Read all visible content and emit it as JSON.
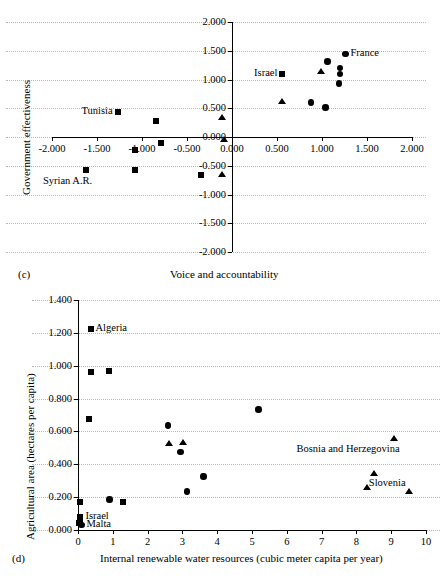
{
  "figure": {
    "panels": [
      "(c)",
      "(d)"
    ]
  },
  "chart_data": [
    {
      "id": "panel-c",
      "type": "scatter",
      "panel_letter": "(c)",
      "title": "",
      "xlabel": "Voice and accountability",
      "ylabel": "Government effectiveness",
      "xlim": [
        -2.0,
        2.0
      ],
      "ylim": [
        -2.0,
        2.0
      ],
      "grid": true,
      "xticks": [
        "-2.000",
        "-1.500",
        "-1.000",
        "-0.500",
        "0.000",
        "0.500",
        "1.000",
        "1.500",
        "2.000"
      ],
      "xtick_values": [
        -2.0,
        -1.5,
        -1.0,
        -0.5,
        0.0,
        0.5,
        1.0,
        1.5,
        2.0
      ],
      "yticks": [
        "2.000",
        "1.500",
        "1.000",
        "0.500",
        "0.000",
        "-0.500",
        "-1.000",
        "-1.500",
        "-2.000"
      ],
      "ytick_values": [
        2.0,
        1.5,
        1.0,
        0.5,
        0.0,
        -0.5,
        -1.0,
        -1.5,
        -2.0
      ],
      "series": [
        {
          "name": "square-series",
          "marker": "square",
          "points": [
            {
              "x": -1.27,
              "y": 0.43,
              "label": "Tunisia",
              "label_pos": "left"
            },
            {
              "x": -0.84,
              "y": 0.28
            },
            {
              "x": -0.79,
              "y": -0.11
            },
            {
              "x": -1.08,
              "y": -0.22
            },
            {
              "x": -1.62,
              "y": -0.58,
              "label": "Syrian A.R.",
              "label_pos": "below-left"
            },
            {
              "x": -1.08,
              "y": -0.58
            },
            {
              "x": -0.34,
              "y": -0.66
            },
            {
              "x": 0.56,
              "y": 1.09,
              "label": "Israel",
              "label_pos": "left"
            }
          ]
        },
        {
          "name": "triangle-series",
          "marker": "triangle",
          "points": [
            {
              "x": -0.11,
              "y": 0.34
            },
            {
              "x": -0.09,
              "y": -0.03
            },
            {
              "x": 0.56,
              "y": 0.63
            },
            {
              "x": 0.99,
              "y": 1.15
            },
            {
              "x": -0.11,
              "y": -0.64
            }
          ]
        },
        {
          "name": "circle-series",
          "marker": "circle",
          "points": [
            {
              "x": 1.26,
              "y": 1.44,
              "label": "France",
              "label_pos": "right"
            },
            {
              "x": 1.06,
              "y": 1.31
            },
            {
              "x": 1.2,
              "y": 1.2
            },
            {
              "x": 1.2,
              "y": 1.1
            },
            {
              "x": 1.19,
              "y": 0.93
            },
            {
              "x": 0.88,
              "y": 0.6
            },
            {
              "x": 1.04,
              "y": 0.51
            }
          ]
        }
      ]
    },
    {
      "id": "panel-d",
      "type": "scatter",
      "panel_letter": "(d)",
      "title": "",
      "xlabel": "Internal renewable water resources (cubic meter capita per year)",
      "ylabel": "Agricultural area (hectares per capita)",
      "xlim": [
        0,
        10
      ],
      "ylim": [
        0.0,
        1.4
      ],
      "grid": true,
      "xticks": [
        "0",
        "1",
        "2",
        "3",
        "4",
        "5",
        "6",
        "7",
        "8",
        "9",
        "10"
      ],
      "xtick_values": [
        0,
        1,
        2,
        3,
        4,
        5,
        6,
        7,
        8,
        9,
        10
      ],
      "yticks": [
        "1.400",
        "1.200",
        "1.000",
        "0.800",
        "0.600",
        "0.400",
        "0.200",
        "0.000"
      ],
      "ytick_values": [
        1.4,
        1.2,
        1.0,
        0.8,
        0.6,
        0.4,
        0.2,
        0.0
      ],
      "series": [
        {
          "name": "square-series",
          "marker": "square",
          "points": [
            {
              "x": 0.36,
              "y": 1.222,
              "label": "Algeria",
              "label_pos": "right"
            },
            {
              "x": 0.38,
              "y": 0.962
            },
            {
              "x": 0.9,
              "y": 0.968
            },
            {
              "x": 0.33,
              "y": 0.678
            },
            {
              "x": 0.07,
              "y": 0.17
            },
            {
              "x": 1.3,
              "y": 0.17
            },
            {
              "x": 0.07,
              "y": 0.078,
              "label": "Israel",
              "label_pos": "right"
            },
            {
              "x": 0.05,
              "y": 0.048
            },
            {
              "x": 0.03,
              "y": 0.04
            }
          ]
        },
        {
          "name": "circle-series",
          "marker": "circle",
          "points": [
            {
              "x": 5.18,
              "y": 0.735
            },
            {
              "x": 2.58,
              "y": 0.637
            },
            {
              "x": 2.95,
              "y": 0.475
            },
            {
              "x": 3.6,
              "y": 0.327
            },
            {
              "x": 3.13,
              "y": 0.235
            },
            {
              "x": 0.9,
              "y": 0.185
            },
            {
              "x": 0.1,
              "y": 0.03,
              "label": "Malta",
              "label_pos": "right"
            }
          ]
        },
        {
          "name": "triangle-series",
          "marker": "triangle",
          "points": [
            {
              "x": 9.07,
              "y": 0.558,
              "label": "Bosnia and Herzegovina",
              "label_pos": "below-left"
            },
            {
              "x": 2.62,
              "y": 0.527
            },
            {
              "x": 3.03,
              "y": 0.537
            },
            {
              "x": 8.52,
              "y": 0.343
            },
            {
              "x": 8.3,
              "y": 0.262
            },
            {
              "x": 9.5,
              "y": 0.237,
              "label": "Slovenia",
              "label_pos": "above-left"
            }
          ]
        }
      ]
    }
  ]
}
